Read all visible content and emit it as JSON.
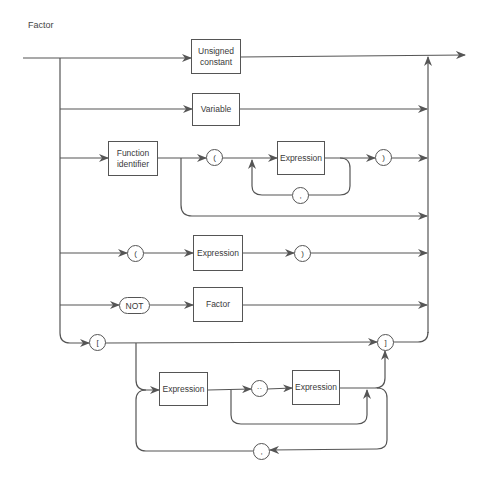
{
  "diagram": {
    "title": "Factor",
    "type": "syntax diagram",
    "nodes": {
      "unsigned_constant": "Unsigned constant",
      "variable": "Variable",
      "function_identifier": "Function identifier",
      "func_open_paren": "(",
      "func_expression": "Expression",
      "func_comma": ",",
      "func_close_paren": ")",
      "paren_open": "(",
      "paren_expression": "Expression",
      "paren_close": ")",
      "not_keyword": "NOT",
      "not_factor": "Factor",
      "set_open_bracket": "[",
      "set_close_bracket": "]",
      "set_expression_1": "Expression",
      "set_range_dots": "··",
      "set_expression_2": "Expression",
      "set_comma": ","
    },
    "paths": [
      [
        "Unsigned constant"
      ],
      [
        "Variable"
      ],
      [
        "Function identifier",
        "(",
        "Expression",
        "{, Expression}",
        ")"
      ],
      [
        "Function identifier"
      ],
      [
        "(",
        "Expression",
        ")"
      ],
      [
        "NOT",
        "Factor"
      ],
      [
        "[",
        "[Expression [.. Expression] {, Expression [.. Expression]}]",
        "]"
      ]
    ],
    "colors": {
      "line": "#555555",
      "text": "#3a3a3a",
      "background": "#ffffff"
    }
  }
}
